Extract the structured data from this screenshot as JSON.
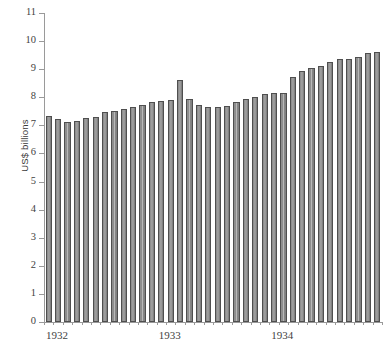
{
  "chart_data": {
    "type": "bar",
    "title": "",
    "subtitle": "",
    "xlabel": "",
    "ylabel": "US$ billions",
    "ylim": [
      0,
      11
    ],
    "ytick_labels": [
      "0",
      "1",
      "2",
      "3",
      "4",
      "5",
      "6",
      "7",
      "8",
      "9",
      "10",
      "11"
    ],
    "ytick_values": [
      0,
      1,
      2,
      3,
      4,
      5,
      6,
      7,
      8,
      9,
      10,
      11
    ],
    "xtick_labels": [
      "1932",
      "1933",
      "1934"
    ],
    "grid": false,
    "legend": null,
    "bar_color": "#8e8e8e",
    "bar_edge_color": "#4f4f4f",
    "axis_color": "#9a9a9a",
    "categories": [
      "1932-01",
      "1932-02",
      "1932-03",
      "1932-04",
      "1932-05",
      "1932-06",
      "1932-07",
      "1932-08",
      "1932-09",
      "1932-10",
      "1932-11",
      "1932-12",
      "1933-01",
      "1933-02",
      "1933-03",
      "1933-04",
      "1933-05",
      "1933-06",
      "1933-07",
      "1933-08",
      "1933-09",
      "1933-10",
      "1933-11",
      "1933-12",
      "1934-01",
      "1934-02",
      "1934-03",
      "1934-04",
      "1934-05",
      "1934-06",
      "1934-07",
      "1934-08",
      "1934-09",
      "1934-10",
      "1934-11",
      "1934-12"
    ],
    "values": [
      7.32,
      7.22,
      7.12,
      7.14,
      7.28,
      7.29,
      7.47,
      7.5,
      7.58,
      7.67,
      7.74,
      7.85,
      7.86,
      7.9,
      8.61,
      7.93,
      7.72,
      7.67,
      7.65,
      7.7,
      7.83,
      7.95,
      8.0,
      8.13,
      8.14,
      8.16,
      8.72,
      8.95,
      9.04,
      9.12,
      9.26,
      9.38,
      9.35,
      9.42,
      9.57,
      9.6
    ],
    "caption": ""
  },
  "figure": {
    "ylabel": "US$ billions",
    "caption": ""
  }
}
